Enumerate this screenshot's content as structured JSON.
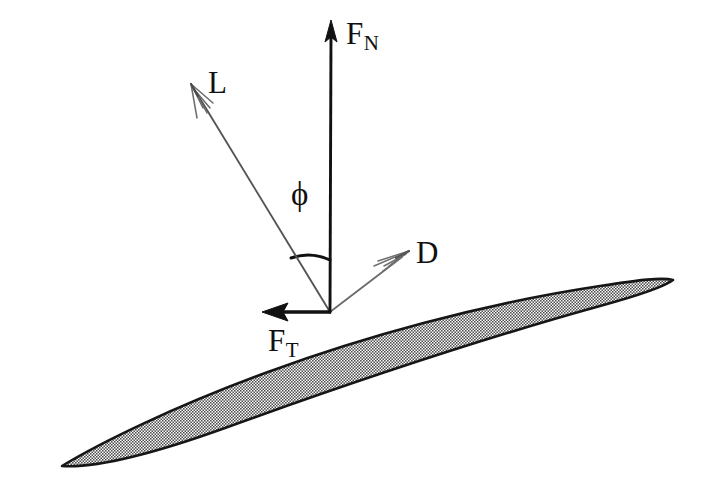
{
  "figure": {
    "background_color": "#ffffff",
    "stroke_color": "#111111",
    "thin_stroke_color": "#4a4a4a",
    "airfoil_fill_color": "#a9a9a9",
    "airfoil_outline_color": "#161616"
  },
  "labels": {
    "normal_force": {
      "symbol": "F",
      "subscript": "N"
    },
    "tangential_force": {
      "symbol": "F",
      "subscript": "T"
    },
    "lift": {
      "symbol": "L",
      "subscript": ""
    },
    "drag": {
      "symbol": "D",
      "subscript": ""
    },
    "angle": {
      "symbol": "ϕ",
      "subscript": ""
    }
  },
  "vectors": [
    {
      "name": "normal-force",
      "label": "F_N",
      "origin": [
        330,
        312
      ],
      "tip": [
        331,
        22
      ],
      "style": "solid-heavy",
      "arrowhead": "filled"
    },
    {
      "name": "lift",
      "label": "L",
      "origin": [
        330,
        312
      ],
      "tip": [
        191,
        84
      ],
      "style": "thin",
      "arrowhead": "open-barbed"
    },
    {
      "name": "drag",
      "label": "D",
      "origin": [
        330,
        312
      ],
      "tip": [
        409,
        251
      ],
      "style": "thin",
      "arrowhead": "open-barbed"
    },
    {
      "name": "tangential-force",
      "label": "F_T",
      "origin": [
        330,
        312
      ],
      "tip": [
        263,
        312
      ],
      "style": "solid-heavy",
      "arrowhead": "concave"
    }
  ],
  "angle_arc": {
    "name": "phi-angle",
    "label": "ϕ",
    "vertex": [
      330,
      312
    ],
    "radius": 52,
    "from_vector": "normal-force",
    "to_vector": "lift"
  },
  "airfoil": {
    "name": "blade-section",
    "leading_edge_tip": [
      62,
      466
    ],
    "trailing_edge_tip": [
      673,
      280
    ],
    "max_thickness_px": 40,
    "fill": "stippled-gray"
  }
}
